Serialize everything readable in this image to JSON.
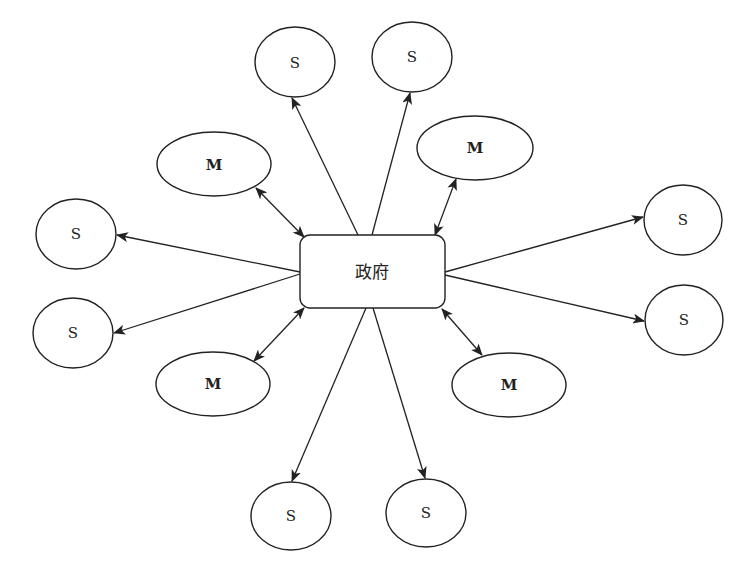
{
  "diagram": {
    "type": "hub-and-spoke",
    "center": {
      "label": "政府",
      "shape": "rounded-rectangle"
    },
    "nodes": [
      {
        "id": "s_top_left",
        "label": "S",
        "relation": "one-way"
      },
      {
        "id": "s_top_right",
        "label": "S",
        "relation": "one-way"
      },
      {
        "id": "m_top_left",
        "label": "M",
        "relation": "two-way"
      },
      {
        "id": "m_top_right",
        "label": "M",
        "relation": "two-way"
      },
      {
        "id": "s_left_top",
        "label": "S",
        "relation": "one-way"
      },
      {
        "id": "s_left_bottom",
        "label": "S",
        "relation": "one-way"
      },
      {
        "id": "s_right_top",
        "label": "S",
        "relation": "one-way"
      },
      {
        "id": "s_right_bottom",
        "label": "S",
        "relation": "one-way"
      },
      {
        "id": "m_bottom_left",
        "label": "M",
        "relation": "two-way"
      },
      {
        "id": "m_bottom_right",
        "label": "M",
        "relation": "two-way"
      },
      {
        "id": "s_bottom_left",
        "label": "S",
        "relation": "one-way"
      },
      {
        "id": "s_bottom_right",
        "label": "S",
        "relation": "one-way"
      }
    ],
    "colors": {
      "stroke": "#222222",
      "background": "#ffffff"
    }
  }
}
